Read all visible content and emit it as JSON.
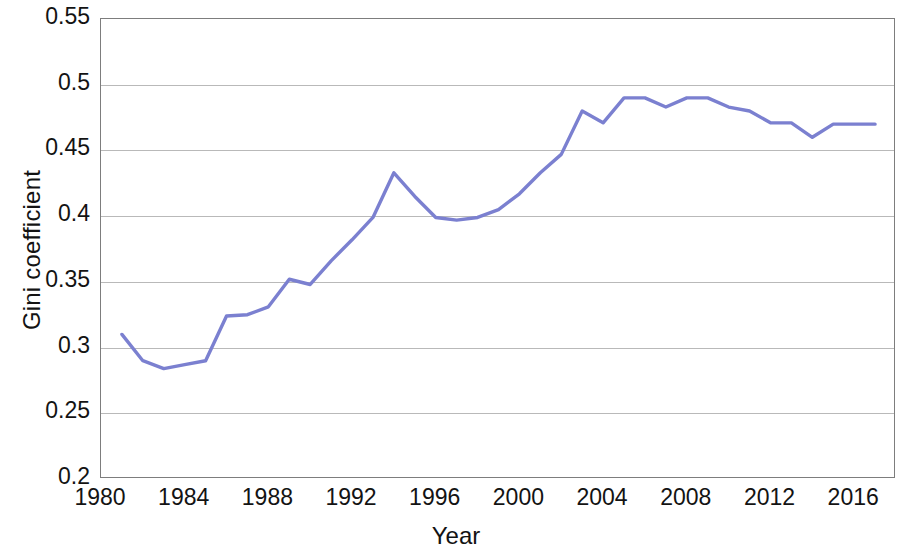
{
  "chart_data": {
    "type": "line",
    "title": "",
    "xlabel": "Year",
    "ylabel": "Gini coefficient",
    "xlim": [
      1980,
      2018
    ],
    "ylim": [
      0.2,
      0.55
    ],
    "xticks": [
      1980,
      1984,
      1988,
      1992,
      1996,
      2000,
      2004,
      2008,
      2012,
      2016
    ],
    "yticks": [
      0.2,
      0.25,
      0.3,
      0.35,
      0.4,
      0.45,
      0.5,
      0.55
    ],
    "ytick_labels": [
      "0.2",
      "0.25",
      "0.3",
      "0.35",
      "0.4",
      "0.45",
      "0.5",
      "0.55"
    ],
    "grid": true,
    "legend": false,
    "line_color": "#7b80d0",
    "series": [
      {
        "name": "Gini coefficient",
        "x": [
          1981,
          1982,
          1983,
          1984,
          1985,
          1986,
          1987,
          1988,
          1989,
          1990,
          1991,
          1992,
          1993,
          1994,
          1995,
          1996,
          1997,
          1998,
          1999,
          2000,
          2001,
          2002,
          2003,
          2004,
          2005,
          2006,
          2007,
          2008,
          2009,
          2010,
          2011,
          2012,
          2013,
          2014,
          2015,
          2016,
          2017
        ],
        "values": [
          0.31,
          0.29,
          0.284,
          0.287,
          0.29,
          0.324,
          0.325,
          0.331,
          0.352,
          0.348,
          0.366,
          0.382,
          0.399,
          0.433,
          0.415,
          0.399,
          0.397,
          0.399,
          0.405,
          0.417,
          0.433,
          0.447,
          0.48,
          0.471,
          0.49,
          0.49,
          0.483,
          0.49,
          0.49,
          0.483,
          0.48,
          0.471,
          0.471,
          0.46,
          0.47,
          0.47,
          0.47
        ]
      }
    ]
  },
  "axis": {
    "y_title": "Gini coefficient",
    "x_title": "Year"
  }
}
